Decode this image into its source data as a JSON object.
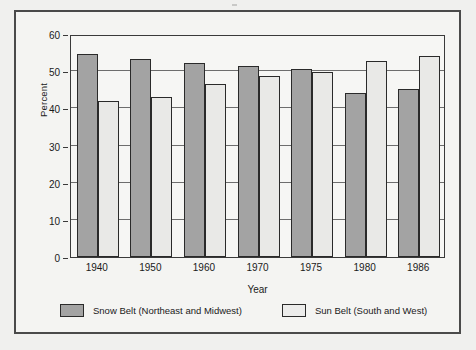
{
  "chart_data": {
    "type": "bar",
    "title": "",
    "subtitle": "",
    "xlabel": "Year",
    "ylabel": "Percent",
    "ylim": [
      0,
      60
    ],
    "ytick_step": 10,
    "yticks": [
      0,
      10,
      20,
      30,
      40,
      50,
      60
    ],
    "ytick_labels": [
      "0",
      "10",
      "20",
      "30",
      "40",
      "50",
      "60"
    ],
    "grid": "horizontal",
    "legend_position": "below",
    "categories": [
      "1940",
      "1950",
      "1960",
      "1970",
      "1975",
      "1980",
      "1986"
    ],
    "series": [
      {
        "name": "Snow Belt (Northeast and Midwest)",
        "color": "#a3a3a3",
        "values": [
          54.6,
          53.4,
          52.3,
          51.5,
          50.6,
          44.2,
          45.3
        ]
      },
      {
        "name": "Sun Belt (South and West)",
        "color": "#e9e9e7",
        "values": [
          42.1,
          43.0,
          46.5,
          48.7,
          49.9,
          52.7,
          54.2
        ]
      }
    ],
    "annotations": []
  },
  "legend": {
    "entries": [
      {
        "label": "Snow Belt (Northeast and Midwest)",
        "swatch": "snow-belt-swatch"
      },
      {
        "label": "Sun Belt (South and West)",
        "swatch": "sun-belt-swatch"
      }
    ]
  },
  "colors": {
    "snow_belt": "#a3a3a3",
    "sun_belt": "#e9e9e7",
    "axis": "#3a3a3a",
    "gridline": "#6d6d6d",
    "frame": "#4a4a4a",
    "page_background": "#f0f0ee",
    "card_background": "#f4f4f2"
  }
}
